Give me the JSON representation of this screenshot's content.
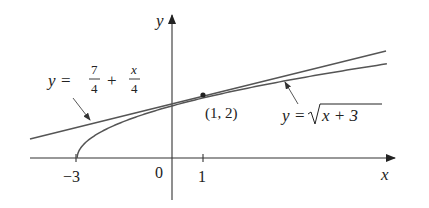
{
  "figure": {
    "axes": {
      "x_label": "x",
      "y_label": "y",
      "origin_label": "0",
      "tick_labels": [
        {
          "value": -3,
          "label": "−3"
        },
        {
          "value": 1,
          "label": "1"
        }
      ]
    },
    "curves": [
      {
        "name": "sqrt-curve",
        "equation_text": "y = √(x + 3)",
        "label_parts": {
          "lhs": "y",
          "eq": "=",
          "radicand": "x + 3"
        },
        "domain": [
          -3,
          6.8
        ]
      },
      {
        "name": "tangent-line",
        "equation_text": "y = 7/4 + x/4",
        "label_parts": {
          "lhs": "y",
          "eq": "=",
          "frac1_num": "7",
          "frac1_den": "4",
          "plus": "+",
          "frac2_num": "x",
          "frac2_den": "4"
        },
        "domain": [
          -4.5,
          6.8
        ]
      }
    ],
    "point": {
      "x": 1,
      "y": 2,
      "label": "(1, 2)"
    },
    "colors": {
      "curve": "#555555",
      "axis": "#333333",
      "text": "#222222",
      "background": "#ffffff"
    }
  }
}
